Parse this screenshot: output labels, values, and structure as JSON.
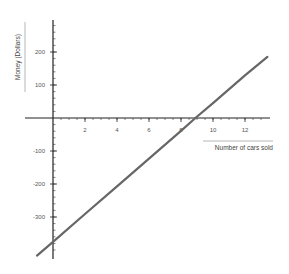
{
  "chart_data": {
    "type": "line",
    "title": "",
    "xlabel": "Number of cars sold",
    "ylabel": "Money (Dollars)",
    "xlim": [
      -1.8,
      13.5
    ],
    "ylim": [
      -420,
      300
    ],
    "x_ticks": [
      2,
      4,
      6,
      8,
      10,
      12
    ],
    "x_tick_labels": [
      "2",
      "4",
      "6",
      "8",
      "10",
      "12"
    ],
    "y_ticks": [
      200,
      100,
      -100,
      -200,
      -300
    ],
    "y_tick_labels": [
      "200",
      "100",
      "-100",
      "-200",
      "-300"
    ],
    "grid": false,
    "legend": null,
    "series": [
      {
        "name": "profit",
        "x": [
          -1,
          0,
          2,
          4,
          6,
          8,
          8.9,
          10,
          12,
          13.4
        ],
        "y": [
          -417,
          -375,
          -291,
          -207,
          -123,
          -39,
          0,
          45,
          129,
          185
        ]
      }
    ],
    "color": "#666666"
  }
}
